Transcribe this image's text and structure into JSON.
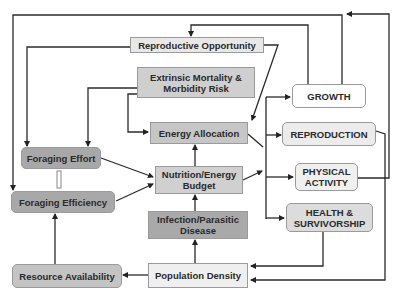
{
  "diagram": {
    "type": "flow-diagram",
    "nodes": {
      "reproductive_opportunity": "Reproductive Opportunity",
      "extrinsic_mortality": "Extrinsic Mortality & Morbidity Risk",
      "energy_allocation": "Energy Allocation",
      "nutrition_budget": "Nutrition/Energy Budget",
      "infection_disease": "Infection/Parasitic Disease",
      "population_density": "Population Density",
      "foraging_effort": "Foraging Effort",
      "foraging_efficiency": "Foraging Efficiency",
      "resource_availability": "Resource Availability",
      "growth": "GROWTH",
      "reproduction": "REPRODUCTION",
      "physical_activity": "PHYSICAL ACTIVITY",
      "health_survivorship": "HEALTH & SURVIVORSHIP"
    },
    "edges": [
      [
        "Reproductive Opportunity",
        "Foraging Efficiency"
      ],
      [
        "Reproductive Opportunity",
        "Energy Allocation"
      ],
      [
        "Extrinsic Mortality & Morbidity Risk",
        "Foraging Effort"
      ],
      [
        "Extrinsic Mortality & Morbidity Risk",
        "Energy Allocation"
      ],
      [
        "Nutrition/Energy Budget",
        "Energy Allocation"
      ],
      [
        "Foraging Effort",
        "Nutrition/Energy Budget"
      ],
      [
        "Foraging Efficiency",
        "Nutrition/Energy Budget"
      ],
      [
        "Foraging Effort",
        "Foraging Efficiency"
      ],
      [
        "Resource Availability",
        "Foraging Efficiency"
      ],
      [
        "Infection/Parasitic Disease",
        "Nutrition/Energy Budget"
      ],
      [
        "Population Density",
        "Infection/Parasitic Disease"
      ],
      [
        "Population Density",
        "Resource Availability"
      ],
      [
        "Energy Allocation",
        "GROWTH"
      ],
      [
        "Energy Allocation",
        "REPRODUCTION"
      ],
      [
        "Energy Allocation",
        "PHYSICAL ACTIVITY"
      ],
      [
        "Energy Allocation",
        "HEALTH & SURVIVORSHIP"
      ],
      [
        "Nutrition/Energy Budget",
        "GROWTH"
      ],
      [
        "GROWTH",
        "Reproductive Opportunity"
      ],
      [
        "GROWTH",
        "Foraging Efficiency"
      ],
      [
        "REPRODUCTION",
        "Population Density"
      ],
      [
        "PHYSICAL ACTIVITY",
        "GROWTH"
      ],
      [
        "HEALTH & SURVIVORSHIP",
        "Population Density"
      ]
    ]
  }
}
